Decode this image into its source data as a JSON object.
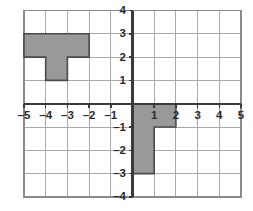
{
  "figure": {
    "name": "coordinate-plane",
    "background_color": "#ffffff"
  },
  "chart_data": {
    "type": "scatter",
    "title": "",
    "subtitle": "",
    "xlabel": "",
    "ylabel": "",
    "xlim": [
      -5,
      5
    ],
    "ylim": [
      -4,
      4
    ],
    "grid": true,
    "grid_step": 1,
    "legend": "none",
    "axis_colors": {
      "grid": "#a9a9a9",
      "axis": "#3a3a3a",
      "border": "#8a8a8a",
      "shape_fill": "#999999",
      "shape_stroke": "#4a4a4a",
      "label": "#2b2b2b"
    },
    "x_ticks": [
      -5,
      -4,
      -3,
      -2,
      -1,
      1,
      2,
      3,
      4,
      5
    ],
    "x_tick_labels": [
      "–5",
      "–4",
      "–3",
      "–2",
      "–1",
      "1",
      "2",
      "3",
      "4",
      "5"
    ],
    "y_ticks": [
      4,
      3,
      2,
      1,
      -1,
      -2,
      -3,
      -4
    ],
    "y_tick_labels": [
      "4",
      "3",
      "2",
      "1",
      "–1",
      "–2",
      "–3",
      "–4"
    ],
    "shapes": [
      {
        "name": "left-figure",
        "label": "T-shaped figure in second quadrant",
        "fill": "#999999",
        "stroke": "#4a4a4a",
        "vertices": [
          [
            -5,
            3
          ],
          [
            -2,
            3
          ],
          [
            -2,
            2
          ],
          [
            -3,
            2
          ],
          [
            -3,
            1
          ],
          [
            -4,
            1
          ],
          [
            -4,
            2
          ],
          [
            -5,
            2
          ]
        ]
      },
      {
        "name": "right-figure",
        "label": "L-shaped figure in fourth quadrant",
        "fill": "#999999",
        "stroke": "#4a4a4a",
        "vertices": [
          [
            0,
            0
          ],
          [
            2,
            0
          ],
          [
            2,
            -1
          ],
          [
            1,
            -1
          ],
          [
            1,
            -3
          ],
          [
            0,
            -3
          ]
        ]
      }
    ]
  }
}
